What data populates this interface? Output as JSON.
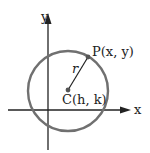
{
  "diagram": {
    "axes": {
      "x_label": "x",
      "y_label": "y"
    },
    "point_p": {
      "label": "P(x, y)"
    },
    "center": {
      "label": "C(h, k)"
    },
    "radius": {
      "label": "r"
    },
    "colors": {
      "circle": "#707070",
      "axis": "#222222",
      "text": "#222222"
    }
  }
}
